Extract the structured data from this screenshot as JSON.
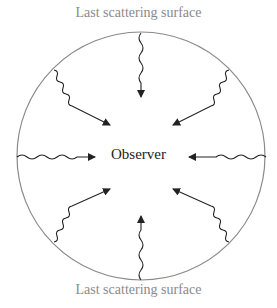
{
  "diagram": {
    "top_label": "Last scattering surface",
    "bottom_label": "Last scattering surface",
    "center_label": "Observer",
    "circle": {
      "cx": 141,
      "cy": 156,
      "r": 124,
      "stroke": "#8a8a8a"
    },
    "rays": 8,
    "ray_color": "#222222"
  }
}
